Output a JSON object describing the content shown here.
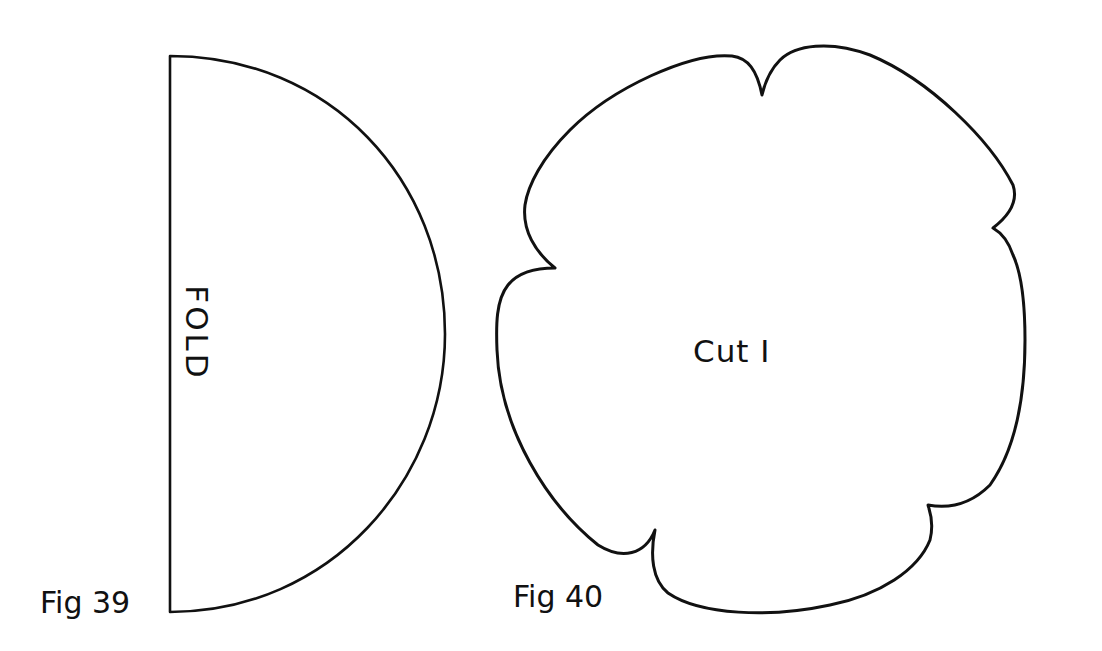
{
  "figures": [
    {
      "id": "fig39",
      "caption": "Fig 39",
      "shape": "half-circle",
      "inner_label": "FOLD",
      "inner_label_orientation": "vertical"
    },
    {
      "id": "fig40",
      "caption": "Fig 40",
      "shape": "five-lobed-scalloped-circle",
      "inner_label": "Cut I",
      "lobe_count": 5
    }
  ],
  "style": {
    "line_color": "#111111",
    "background": "#ffffff"
  }
}
